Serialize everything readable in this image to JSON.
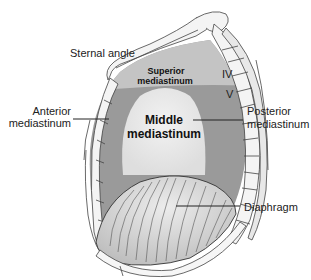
{
  "diagram": {
    "labels": {
      "sternal_angle": "Sternal angle",
      "superior_line1": "Superior",
      "superior_line2": "mediastinum",
      "anterior_line1": "Anterior",
      "anterior_line2": "mediastinum",
      "middle_line1": "Middle",
      "middle_line2": "mediastinum",
      "posterior_line1": "Posterior",
      "posterior_line2": "mediastinum",
      "diaphragm": "Diaphragm",
      "vertebra_iv": "IV",
      "vertebra_v": "V"
    },
    "colors": {
      "superior_region": "#c4c4c4",
      "anterior_posterior_region": "#9a9a9a",
      "middle_region": "#e6e6e6",
      "diaphragm": "#d6d6d6",
      "bone": "#f4f4f4",
      "outline": "#444444",
      "text": "#222222"
    }
  }
}
